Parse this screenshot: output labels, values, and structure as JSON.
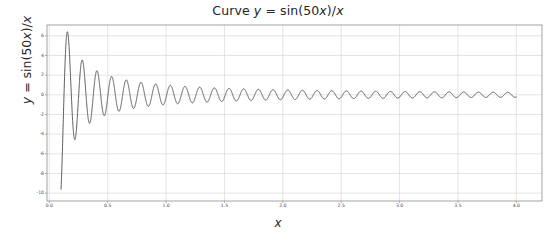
{
  "chart_data": {
    "type": "line",
    "title": "Curve y = sin(50x)/x",
    "title_parts": {
      "prefix": "Curve ",
      "var_y": "y",
      "mid": " = sin(50",
      "var_x1": "x",
      "suffix": ")/",
      "var_x2": "x"
    },
    "xlabel": "x",
    "ylabel": "y = sin(50x)/x",
    "ylabel_parts": {
      "var_y": "y",
      "mid": " = sin(50",
      "var_x1": "x",
      "suffix": ")/",
      "var_x2": "x"
    },
    "function": "sin(50*x)/x",
    "frequency": 50,
    "grid": true,
    "legend": false,
    "legend_position": "none",
    "line_color": "#4a4a4a",
    "grid_color": "#d9d9d9",
    "frame_color": "#8c8c8c",
    "background_color": "#ffffff",
    "text_color": "#262626",
    "xlim": [
      -0.02,
      4.22
    ],
    "ylim": [
      -10.8,
      7.1
    ],
    "x_domain_data": [
      0.1,
      4.0
    ],
    "xticks": [
      0.0,
      0.5,
      1.0,
      1.5,
      2.0,
      2.5,
      3.0,
      3.5,
      4.0
    ],
    "xtick_labels": [
      "0.0",
      "0.5",
      "1.0",
      "1.5",
      "2.0",
      "2.5",
      "3.0",
      "3.5",
      "4.0"
    ],
    "yticks": [
      6,
      4,
      2,
      0,
      -2,
      -4,
      -6,
      -8,
      -10
    ],
    "ytick_labels": [
      "6",
      "4",
      "2",
      "0",
      "-2",
      "-4",
      "-6",
      "-8",
      "-10"
    ],
    "sample_points": [
      {
        "x": 0.1,
        "y": -9.58
      },
      {
        "x": 0.126,
        "y": 6.19
      },
      {
        "x": 0.16,
        "y": -4.49
      },
      {
        "x": 0.19,
        "y": 3.62
      },
      {
        "x": 0.225,
        "y": -2.79
      },
      {
        "x": 0.255,
        "y": 2.56
      },
      {
        "x": 0.29,
        "y": -2.1
      },
      {
        "x": 0.32,
        "y": 1.98
      },
      {
        "x": 0.355,
        "y": -1.72
      },
      {
        "x": 0.385,
        "y": 1.62
      },
      {
        "x": 0.5,
        "y": 1.41
      },
      {
        "x": 0.75,
        "y": 1.29
      },
      {
        "x": 1.0,
        "y": 1.0
      },
      {
        "x": 1.5,
        "y": 0.66
      },
      {
        "x": 2.0,
        "y": 0.5
      },
      {
        "x": 2.5,
        "y": 0.4
      },
      {
        "x": 3.0,
        "y": 0.33
      },
      {
        "x": 3.5,
        "y": 0.28
      },
      {
        "x": 4.0,
        "y": 0.25
      }
    ],
    "envelope_note": "amplitude = 1/x, decaying oscillation"
  }
}
